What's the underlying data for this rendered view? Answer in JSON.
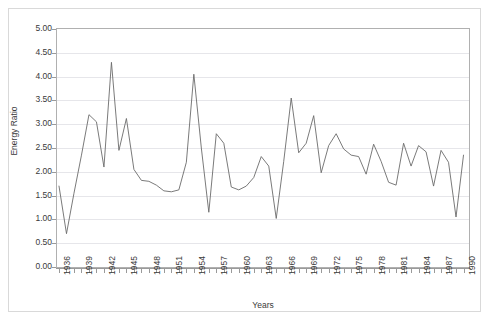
{
  "chart_data": {
    "type": "line",
    "title": "",
    "xlabel": "Years",
    "ylabel": "Energy Ratio",
    "ylim": [
      0.0,
      5.0
    ],
    "ytick_step": 0.5,
    "ytick_labels": [
      "5.00",
      "4.50",
      "4.00",
      "3.50",
      "3.00",
      "2.50",
      "2.00",
      "1.50",
      "1.00",
      "0.50",
      "0.00"
    ],
    "ytick_values": [
      5.0,
      4.5,
      4.0,
      3.5,
      3.0,
      2.5,
      2.0,
      1.5,
      1.0,
      0.5,
      0.0
    ],
    "xlim": [
      1936,
      1991
    ],
    "xtick_label_step": 3,
    "xtick_labels": [
      "1936",
      "1939",
      "1942",
      "1945",
      "1948",
      "1951",
      "1954",
      "1957",
      "1960",
      "1963",
      "1966",
      "1969",
      "1972",
      "1975",
      "1978",
      "1981",
      "1984",
      "1987",
      "1990"
    ],
    "grid": true,
    "grid_axis": "y",
    "legend": false,
    "legend_position": "none",
    "line_color": "#6b6b6b",
    "grid_color": "#e6e6ea",
    "axis_color": "#9a9a9a",
    "background_color": "#ffffff",
    "x": [
      1936,
      1937,
      1938,
      1939,
      1940,
      1941,
      1942,
      1943,
      1944,
      1945,
      1946,
      1947,
      1948,
      1949,
      1950,
      1951,
      1952,
      1953,
      1954,
      1955,
      1956,
      1957,
      1958,
      1959,
      1960,
      1961,
      1962,
      1963,
      1964,
      1965,
      1966,
      1967,
      1968,
      1969,
      1970,
      1971,
      1972,
      1973,
      1974,
      1975,
      1976,
      1977,
      1978,
      1979,
      1980,
      1981,
      1982,
      1983,
      1984,
      1985,
      1986,
      1987,
      1988,
      1989,
      1990
    ],
    "series": [
      {
        "name": "Energy Ratio",
        "values": [
          1.7,
          0.7,
          1.55,
          2.35,
          3.2,
          3.05,
          2.1,
          4.3,
          2.45,
          3.12,
          2.05,
          1.82,
          1.8,
          1.72,
          1.6,
          1.58,
          1.62,
          2.2,
          4.05,
          2.5,
          1.15,
          2.8,
          2.6,
          1.68,
          1.62,
          1.7,
          1.88,
          2.32,
          2.12,
          1.02,
          2.22,
          3.55,
          2.4,
          2.6,
          3.18,
          1.98,
          2.55,
          2.8,
          2.48,
          2.35,
          2.32,
          1.95,
          2.58,
          2.22,
          1.78,
          1.72,
          2.6,
          2.12,
          2.55,
          2.42,
          1.7,
          2.45,
          2.2,
          1.05,
          2.35
        ],
        "color": "#6b6b6b"
      }
    ]
  },
  "axes": {
    "y_title": "Energy Ratio",
    "x_title": "Years"
  }
}
